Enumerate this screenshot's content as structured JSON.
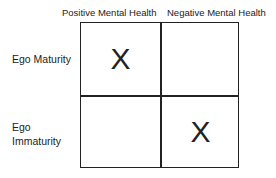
{
  "columns": [
    "Positive Mental Health",
    "Negative Mental Health"
  ],
  "rows": [
    {
      "label_lines": [
        "Ego Maturity"
      ],
      "cells": [
        "X",
        ""
      ]
    },
    {
      "label_lines": [
        "Ego",
        "Immaturity"
      ],
      "cells": [
        "",
        "X"
      ]
    }
  ]
}
